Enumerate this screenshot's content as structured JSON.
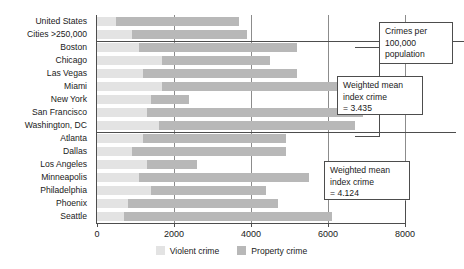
{
  "chart_data": {
    "type": "bar",
    "orientation": "horizontal",
    "stacked": true,
    "title": "",
    "xlabel": "",
    "ylabel": "",
    "xlim": [
      0,
      8000
    ],
    "xticks": [
      0,
      2000,
      4000,
      6000,
      8000
    ],
    "xtick_labels": [
      "0",
      "2000",
      "4000",
      "6000",
      "8000"
    ],
    "grid": true,
    "legend_position": "bottom",
    "categories": [
      "United States",
      "Cities >250,000",
      "Boston",
      "Chicago",
      "Las Vegas",
      "Miami",
      "New York",
      "San Francisco",
      "Washington, DC",
      "Atlanta",
      "Dallas",
      "Los Angeles",
      "Minneapolis",
      "Philadelphia",
      "Phoenix",
      "Seattle"
    ],
    "series": [
      {
        "name": "Violent crime",
        "color": "#e3e3e3",
        "values": [
          500,
          900,
          1100,
          1700,
          1200,
          1700,
          1400,
          1300,
          1600,
          1200,
          900,
          1300,
          1100,
          1400,
          800,
          700
        ]
      },
      {
        "name": "Property crime",
        "color": "#b8b8b8",
        "values": [
          3200,
          3000,
          4100,
          2800,
          4000,
          5500,
          1000,
          5600,
          5100,
          3700,
          4000,
          1300,
          4400,
          3000,
          3900,
          5400
        ]
      }
    ],
    "totals": [
      3700,
      3900,
      5200,
      4500,
      5200,
      7200,
      2400,
      6900,
      6700,
      4900,
      4900,
      2600,
      5500,
      4400,
      4700,
      6100
    ],
    "group_dividers_after": [
      "Cities >250,000",
      "Washington, DC"
    ]
  },
  "annotations": {
    "units_box": {
      "lines": [
        "Crimes per",
        "100,000",
        "population"
      ]
    },
    "mean_box_upper": {
      "lines": [
        "Weighted mean",
        "index crime",
        "= 3.435"
      ],
      "value": "3.435"
    },
    "mean_box_lower": {
      "lines": [
        "Weighted mean",
        "index crime",
        "= 4.124"
      ],
      "value": "4.124"
    }
  },
  "legend": {
    "items": [
      {
        "label": "Violent crime",
        "color": "#e3e3e3"
      },
      {
        "label": "Property crime",
        "color": "#b8b8b8"
      }
    ]
  },
  "colors": {
    "violent": "#e3e3e3",
    "property": "#b8b8b8",
    "axis": "#4d4d4d",
    "grid": "#8c8c8c",
    "background": "#ffffff",
    "text": "#1a1a1a"
  }
}
